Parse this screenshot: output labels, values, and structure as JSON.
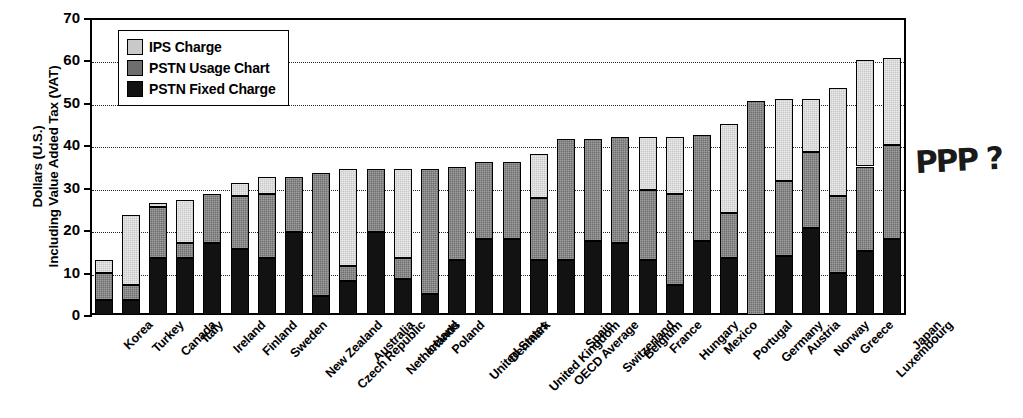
{
  "chart_data": {
    "type": "bar",
    "subtype": "stacked-bar",
    "title": "",
    "xlabel": "",
    "ylabel": "Dollars (U.S.) Including Value Added Tax (VAT)",
    "ylabel_lines": [
      "Dollars (U.S.)",
      "Including Value Added Tax (VAT)"
    ],
    "ylim": [
      0,
      70
    ],
    "yticks": [
      0,
      10,
      20,
      30,
      40,
      50,
      60,
      70
    ],
    "grid": true,
    "grid_style": "dotted-horizontal",
    "legend_position": "top-left-inside",
    "categories": [
      "Korea",
      "Turkey",
      "Canada",
      "Italy",
      "Ireland",
      "Finland",
      "Sweden",
      "New Zealand",
      "Czech Republic",
      "Australia",
      "Netherlands",
      "Iceland",
      "Poland",
      "United States",
      "Denmark",
      "United Kingdom",
      "OECD Average",
      "Spain",
      "Switzerland",
      "Belgium",
      "France",
      "Hungary",
      "Mexico",
      "Portugal",
      "Germany",
      "Austria",
      "Norway",
      "Greece",
      "Luxembourg",
      "Japan"
    ],
    "series": [
      {
        "name": "PSTN Fixed Charge",
        "color": "#121212",
        "values": [
          3.5,
          3.5,
          13.5,
          13.5,
          17.0,
          15.5,
          13.5,
          19.5,
          4.5,
          8.0,
          19.5,
          8.5,
          5.0,
          13.0,
          18.0,
          18.0,
          13.0,
          13.0,
          17.5,
          17.0,
          13.0,
          7.0,
          17.5,
          13.5,
          0.0,
          14.0,
          20.5,
          10.0,
          15.0,
          18.0
        ]
      },
      {
        "name": "PSTN Usage Chart",
        "color": "#6e6e6e",
        "values": [
          6.5,
          3.5,
          12.0,
          3.5,
          11.5,
          12.5,
          15.0,
          13.0,
          29.0,
          3.5,
          15.0,
          5.0,
          29.5,
          22.0,
          18.0,
          18.0,
          14.5,
          28.5,
          24.0,
          25.0,
          16.5,
          21.5,
          25.0,
          10.5,
          50.5,
          17.5,
          18.0,
          18.0,
          20.0,
          22.0
        ]
      },
      {
        "name": "IPS Charge",
        "color": "#c9c9c9",
        "values": [
          3.0,
          16.5,
          1.0,
          10.0,
          0.0,
          3.0,
          4.0,
          0.0,
          0.0,
          23.0,
          0.0,
          21.0,
          0.0,
          0.0,
          0.0,
          0.0,
          10.5,
          0.0,
          0.0,
          0.0,
          12.5,
          13.5,
          0.0,
          21.0,
          0.0,
          19.5,
          12.5,
          25.5,
          25.0,
          20.5
        ]
      }
    ],
    "totals": [
      13.0,
      23.5,
      26.5,
      27.0,
      28.5,
      31.0,
      32.5,
      32.5,
      33.5,
      34.5,
      34.5,
      34.5,
      34.5,
      35.0,
      36.0,
      36.0,
      38.0,
      41.5,
      41.5,
      42.0,
      42.0,
      42.0,
      42.5,
      45.0,
      50.5,
      51.0,
      51.0,
      53.5,
      60.0,
      60.5
    ]
  },
  "legend": {
    "items": [
      {
        "label": "IPS Charge",
        "swatch": "ips"
      },
      {
        "label": "PSTN Usage Chart",
        "swatch": "usage"
      },
      {
        "label": "PSTN Fixed Charge",
        "swatch": "fixed"
      }
    ]
  },
  "annotation": {
    "handwritten_note": "PPP ?"
  }
}
